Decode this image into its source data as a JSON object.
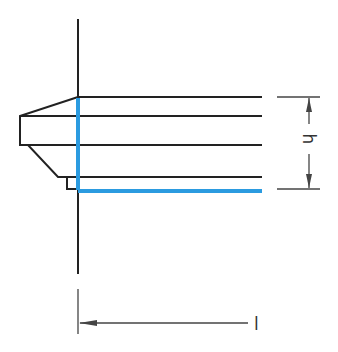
{
  "diagram": {
    "labels": {
      "height": "h",
      "length": "l"
    },
    "colors": {
      "line": "#222222",
      "highlight": "#2b9be0",
      "dimension": "#444444"
    }
  }
}
